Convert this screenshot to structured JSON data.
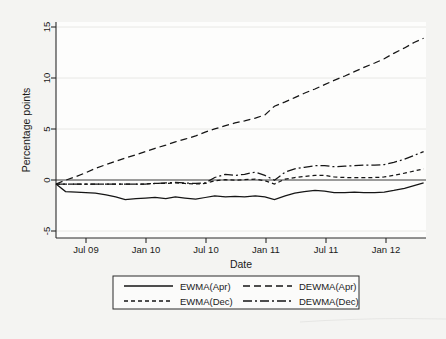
{
  "chart_data": {
    "type": "line",
    "title": "",
    "xlabel": "Date",
    "ylabel": "Percentage points",
    "grid": true,
    "legend_position": "bottom",
    "xlim": [
      2009.25,
      2012.35
    ],
    "ylim": [
      -5,
      15
    ],
    "yticks": [
      -5,
      0,
      5,
      10,
      15
    ],
    "ytick_labels": [
      "-5",
      "0",
      "5",
      "10",
      "15"
    ],
    "xticks": [
      2009.5,
      2010.0,
      2010.5,
      2011.0,
      2011.5,
      2012.0
    ],
    "xtick_labels": [
      "Jul 09",
      "Jan 10",
      "Jul 10",
      "Jan 11",
      "Jul 11",
      "Jan 12"
    ],
    "x": [
      2009.25,
      2009.33,
      2009.42,
      2009.5,
      2009.58,
      2009.67,
      2009.75,
      2009.83,
      2009.92,
      2010.0,
      2010.08,
      2010.17,
      2010.25,
      2010.33,
      2010.42,
      2010.5,
      2010.58,
      2010.67,
      2010.75,
      2010.83,
      2010.92,
      2011.0,
      2011.08,
      2011.17,
      2011.25,
      2011.33,
      2011.42,
      2011.5,
      2011.58,
      2011.67,
      2011.75,
      2011.83,
      2011.92,
      2012.0,
      2012.08,
      2012.17,
      2012.25,
      2012.33
    ],
    "series": [
      {
        "name": "EWMA(Apr)",
        "dash": "solid",
        "values": [
          0.0,
          -0.7,
          -0.75,
          -0.8,
          -0.85,
          -1.0,
          -1.2,
          -1.45,
          -1.35,
          -1.3,
          -1.25,
          -1.35,
          -1.2,
          -1.3,
          -1.4,
          -1.25,
          -1.1,
          -1.2,
          -1.15,
          -1.2,
          -1.1,
          -1.2,
          -1.45,
          -1.1,
          -0.85,
          -0.7,
          -0.6,
          -0.65,
          -0.8,
          -0.8,
          -0.75,
          -0.8,
          -0.8,
          -0.75,
          -0.6,
          -0.4,
          -0.15,
          0.1
        ]
      },
      {
        "name": "EWMA(Dec)",
        "dash": "dashed",
        "values": [
          0.0,
          0.0,
          0.0,
          0.0,
          0.0,
          0.0,
          0.0,
          0.0,
          0.0,
          0.0,
          0.05,
          0.05,
          0.1,
          0.05,
          0.0,
          0.05,
          0.3,
          0.4,
          0.35,
          0.4,
          0.45,
          0.3,
          0.0,
          0.45,
          0.6,
          0.7,
          0.8,
          0.8,
          0.65,
          0.6,
          0.6,
          0.6,
          0.6,
          0.65,
          0.8,
          1.0,
          1.2,
          1.4
        ]
      },
      {
        "name": "DEWMA(Apr)",
        "dash": "dashed-long",
        "values": [
          0.0,
          0.35,
          0.7,
          1.05,
          1.45,
          1.8,
          2.1,
          2.4,
          2.7,
          3.0,
          3.3,
          3.6,
          3.9,
          4.15,
          4.45,
          4.8,
          5.1,
          5.4,
          5.65,
          5.85,
          6.1,
          6.4,
          7.2,
          7.6,
          8.0,
          8.4,
          8.8,
          9.2,
          9.6,
          10.0,
          10.4,
          10.8,
          11.2,
          11.6,
          12.1,
          12.6,
          13.1,
          13.5
        ]
      },
      {
        "name": "DEWMA(Dec)",
        "dash": "dash-dot",
        "values": [
          0.0,
          0.0,
          0.0,
          0.0,
          0.0,
          0.0,
          0.0,
          0.0,
          0.0,
          0.0,
          0.05,
          0.1,
          0.15,
          0.1,
          0.05,
          0.1,
          0.6,
          0.9,
          0.8,
          0.9,
          1.1,
          0.8,
          0.35,
          1.1,
          1.4,
          1.55,
          1.7,
          1.7,
          1.6,
          1.65,
          1.7,
          1.75,
          1.75,
          1.8,
          2.0,
          2.3,
          2.65,
          3.0
        ]
      }
    ]
  },
  "legend": {
    "entries": [
      {
        "label": "EWMA(Apr)",
        "dash": "solid"
      },
      {
        "label": "DEWMA(Apr)",
        "dash": "dashed-long"
      },
      {
        "label": "EWMA(Dec)",
        "dash": "dashed"
      },
      {
        "label": "DEWMA(Dec)",
        "dash": "dash-dot"
      }
    ]
  },
  "colors": {
    "line": "#151515",
    "plot_background": "#fdfdfc",
    "page_background": "#f4f4f2",
    "grid": "#e2e2e0",
    "axis": "#2b2b2b"
  }
}
